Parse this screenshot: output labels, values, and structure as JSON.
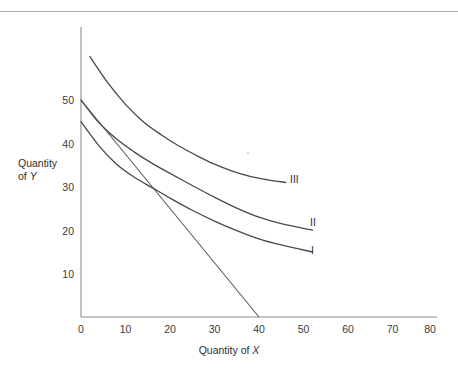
{
  "figure": {
    "name": "indifference-curve-diagram",
    "background_color": "#ffffff",
    "line_color": "#4a4a50",
    "axis_color": "#8c8c90",
    "top_rule_color": "#a9a9ad"
  },
  "chart_data": {
    "type": "line",
    "title": "",
    "xlabel": "Quantity of X",
    "ylabel": "Quantity of Y",
    "xlim": [
      0,
      82
    ],
    "ylim": [
      0,
      65
    ],
    "xticks": [
      0,
      10,
      20,
      30,
      40,
      50,
      60,
      70,
      80
    ],
    "xticklabels": [
      "0",
      "10",
      "20",
      "30",
      "40",
      "50",
      "60",
      "70",
      "80"
    ],
    "yticks": [
      10,
      20,
      30,
      40,
      50
    ],
    "yticklabels": [
      "10",
      "20",
      "30",
      "40",
      "50"
    ],
    "grid": false,
    "legend": "inline-right-end-labels",
    "series": [
      {
        "name": "I",
        "label": "I",
        "kind": "indifference-curve",
        "label_position": {
          "x": 52.5,
          "y": 15
        },
        "points": [
          {
            "x": 0,
            "y": 45
          },
          {
            "x": 4,
            "y": 39.5
          },
          {
            "x": 8,
            "y": 35.2
          },
          {
            "x": 12,
            "y": 32.2
          },
          {
            "x": 16,
            "y": 29.8
          },
          {
            "x": 20,
            "y": 27.4
          },
          {
            "x": 25,
            "y": 24.6
          },
          {
            "x": 30,
            "y": 22.1
          },
          {
            "x": 35,
            "y": 19.9
          },
          {
            "x": 40,
            "y": 18.0
          },
          {
            "x": 45,
            "y": 16.6
          },
          {
            "x": 52,
            "y": 15.0
          }
        ]
      },
      {
        "name": "II",
        "label": "II",
        "kind": "indifference-curve",
        "label_position": {
          "x": 52.5,
          "y": 20
        },
        "points": [
          {
            "x": 0,
            "y": 50
          },
          {
            "x": 4,
            "y": 44.8
          },
          {
            "x": 8,
            "y": 41.0
          },
          {
            "x": 12,
            "y": 38.0
          },
          {
            "x": 16,
            "y": 35.4
          },
          {
            "x": 20,
            "y": 33.1
          },
          {
            "x": 25,
            "y": 30.3
          },
          {
            "x": 30,
            "y": 27.6
          },
          {
            "x": 35,
            "y": 25.1
          },
          {
            "x": 40,
            "y": 23.0
          },
          {
            "x": 45,
            "y": 21.5
          },
          {
            "x": 52,
            "y": 20.0
          }
        ]
      },
      {
        "name": "III",
        "label": "III",
        "kind": "indifference-curve",
        "label_position": {
          "x": 47.5,
          "y": 31
        },
        "points": [
          {
            "x": 2,
            "y": 60
          },
          {
            "x": 6,
            "y": 54.0
          },
          {
            "x": 10,
            "y": 49.0
          },
          {
            "x": 14,
            "y": 45.0
          },
          {
            "x": 18,
            "y": 42.0
          },
          {
            "x": 22,
            "y": 39.4
          },
          {
            "x": 26,
            "y": 37.2
          },
          {
            "x": 30,
            "y": 35.2
          },
          {
            "x": 34,
            "y": 33.6
          },
          {
            "x": 38,
            "y": 32.4
          },
          {
            "x": 42,
            "y": 31.6
          },
          {
            "x": 46,
            "y": 31.0
          }
        ]
      },
      {
        "name": "budget-line",
        "label": "",
        "kind": "budget-constraint",
        "points": [
          {
            "x": 0,
            "y": 50
          },
          {
            "x": 40,
            "y": 0
          }
        ]
      }
    ],
    "annotations": [
      {
        "text": "tangency of budget line with curve I near (16, 30)",
        "x": 16,
        "y": 30
      }
    ]
  },
  "labels": {
    "y_axis_line1": "Quantity",
    "y_axis_line2_prefix": "of ",
    "y_axis_line2_var": "Y",
    "x_axis_prefix": "Quantity of ",
    "x_axis_var": "X",
    "curve_i": "I",
    "curve_ii": "II",
    "curve_iii": "III"
  }
}
